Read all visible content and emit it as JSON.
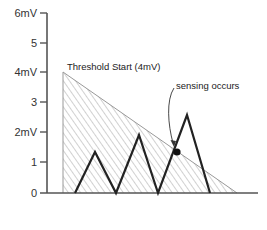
{
  "diagram": {
    "y_axis": {
      "ticks": [
        {
          "label": "6mV",
          "value": 6
        },
        {
          "label": "5",
          "value": 5
        },
        {
          "label": "4mV",
          "value": 4
        },
        {
          "label": "3",
          "value": 3
        },
        {
          "label": "2mV",
          "value": 2
        },
        {
          "label": "1",
          "value": 1
        },
        {
          "label": "0",
          "value": 0
        }
      ]
    },
    "threshold": {
      "label": "Threshold Start (4mV)",
      "start_value": 4
    },
    "annotation": {
      "label": "sensing occurs"
    },
    "signal_peaks_mV": [
      1.4,
      1.95,
      2.6
    ],
    "colors": {
      "axis": "#555555",
      "signal": "#222222",
      "hatch": "#999999"
    }
  }
}
